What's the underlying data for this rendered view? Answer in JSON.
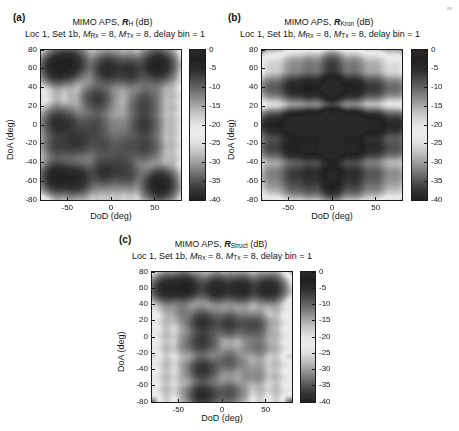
{
  "figure": {
    "background": "#ffffff",
    "panel_count": 3
  },
  "panels": [
    {
      "key": "a",
      "label": "(a)",
      "title_prefix": "MIMO APS, ",
      "title_symbol": "R",
      "title_subscript": "H",
      "title_suffix": " (dB)",
      "subtitle_parts": {
        "loc": "Loc 1, Set 1b, ",
        "m_rx_var": "M",
        "m_rx_sub": "Rx",
        "m_rx_val": " = 8, ",
        "m_tx_var": "M",
        "m_tx_sub": "Tx",
        "m_tx_val": " = 8, delay bin = 1"
      },
      "subtitle_plain": "Loc 1, Set 1b, M_Rx = 8, M_Tx = 8, delay bin = 1",
      "xlabel": "DoD (deg)",
      "ylabel": "DoA (deg)",
      "xticks": [
        -50,
        0,
        50
      ],
      "yticks": [
        80,
        60,
        40,
        20,
        0,
        -20,
        -40,
        -60,
        -80
      ],
      "xlim": [
        -80,
        80
      ],
      "ylim": [
        -80,
        80
      ],
      "colorbar": {
        "ticks": [
          0,
          -5,
          -10,
          -15,
          -20,
          -25,
          -30,
          -35,
          -40
        ],
        "tick_labels": [
          "0",
          "-5",
          "-10",
          "-15",
          "-20",
          "-25",
          "-30",
          "-35",
          "-40"
        ],
        "range": [
          -40,
          0
        ],
        "unit": "dB"
      }
    },
    {
      "key": "b",
      "label": "(b)",
      "title_prefix": "MIMO APS, ",
      "title_symbol": "R",
      "title_subscript": "Kron",
      "title_suffix": " (dB)",
      "subtitle_parts": {
        "loc": "Loc 1, Set 1b, ",
        "m_rx_var": "M",
        "m_rx_sub": "Rx",
        "m_rx_val": " = 8, ",
        "m_tx_var": "M",
        "m_tx_sub": "Tx",
        "m_tx_val": " = 8, delay bin = 1"
      },
      "subtitle_plain": "Loc 1, Set 1b, M_Rx = 8, M_Tx = 8, delay bin = 1",
      "xlabel": "DoD (deg)",
      "ylabel": "DoA (deg)",
      "xticks": [
        -50,
        0,
        50
      ],
      "yticks": [
        80,
        60,
        40,
        20,
        0,
        -20,
        -40,
        -60,
        -80
      ],
      "xlim": [
        -80,
        80
      ],
      "ylim": [
        -80,
        80
      ],
      "colorbar": {
        "ticks": [
          0,
          -5,
          -10,
          -15,
          -20,
          -25,
          -30,
          -35,
          -40
        ],
        "tick_labels": [
          "0",
          "-5",
          "-10",
          "-15",
          "-20",
          "-25",
          "-30",
          "-35",
          "-40"
        ],
        "range": [
          -40,
          0
        ],
        "unit": "dB"
      }
    },
    {
      "key": "c",
      "label": "(c)",
      "title_prefix": "MIMO APS, ",
      "title_symbol": "R",
      "title_subscript": "Struct",
      "title_suffix": " (dB)",
      "subtitle_parts": {
        "loc": "Loc 1, Set 1b, ",
        "m_rx_var": "M",
        "m_rx_sub": "Rx",
        "m_rx_val": " = 8, ",
        "m_tx_var": "M",
        "m_tx_sub": "Tx",
        "m_tx_val": " = 8, delay bin = 1"
      },
      "subtitle_plain": "Loc 1, Set 1b, M_Rx = 8, M_Tx = 8, delay bin = 1",
      "xlabel": "DoD (deg)",
      "ylabel": "DoA (deg)",
      "xticks": [
        -50,
        0,
        50
      ],
      "yticks": [
        80,
        60,
        40,
        20,
        0,
        -20,
        -40,
        -60,
        -80
      ],
      "xlim": [
        -80,
        80
      ],
      "ylim": [
        -80,
        80
      ],
      "colorbar": {
        "ticks": [
          0,
          -5,
          -10,
          -15,
          -20,
          -25,
          -30,
          -35,
          -40
        ],
        "tick_labels": [
          "0",
          "-5",
          "-10",
          "-15",
          "-20",
          "-25",
          "-30",
          "-35",
          "-40"
        ],
        "range": [
          -40,
          0
        ],
        "unit": "dB"
      }
    }
  ],
  "chart_data": [
    {
      "type": "heatmap",
      "panel": "a",
      "title": "MIMO APS, R_H (dB)",
      "subtitle": "Loc 1, Set 1b, M_Rx = 8, M_Tx = 8, delay bin = 1",
      "xlabel": "DoD (deg)",
      "ylabel": "DoA (deg)",
      "xlim": [
        -80,
        80
      ],
      "ylim": [
        -80,
        80
      ],
      "zlim": [
        -40,
        0
      ],
      "zunit": "dB",
      "grid": false,
      "legend": "colorbar-right",
      "colormap": "gray-scanned-dark-bright-dark",
      "dod_lobes": [
        -62,
        -46,
        -30,
        -16,
        -4,
        8,
        22,
        38,
        54,
        70
      ],
      "doa_lobes": [
        -68,
        -52,
        -36,
        -22,
        -8,
        4,
        18,
        32,
        48,
        64
      ],
      "peaks": [
        {
          "dod": -62,
          "doa": 62,
          "level": -3
        },
        {
          "dod": -46,
          "doa": 66,
          "level": -4
        },
        {
          "dod": -4,
          "doa": 60,
          "level": -5
        },
        {
          "dod": 22,
          "doa": 58,
          "level": -6
        },
        {
          "dod": 54,
          "doa": 64,
          "level": -3
        },
        {
          "dod": -16,
          "doa": 28,
          "level": -7
        },
        {
          "dod": 38,
          "doa": 22,
          "level": -8
        },
        {
          "dod": 46,
          "doa": 40,
          "level": -14
        },
        {
          "dod": -62,
          "doa": 2,
          "level": -6
        },
        {
          "dod": -46,
          "doa": 0,
          "level": -9
        },
        {
          "dod": -18,
          "doa": 0,
          "level": -9
        },
        {
          "dod": 10,
          "doa": -2,
          "level": -16
        },
        {
          "dod": 38,
          "doa": 0,
          "level": -7
        },
        {
          "dod": -28,
          "doa": -12,
          "level": -12
        },
        {
          "dod": -62,
          "doa": -22,
          "level": -8
        },
        {
          "dod": -40,
          "doa": -20,
          "level": -7
        },
        {
          "dod": -10,
          "doa": -22,
          "level": -9
        },
        {
          "dod": 18,
          "doa": -22,
          "level": -10
        },
        {
          "dod": 40,
          "doa": -24,
          "level": -8
        },
        {
          "dod": 10,
          "doa": -38,
          "level": -11
        },
        {
          "dod": -62,
          "doa": -56,
          "level": -3
        },
        {
          "dod": -40,
          "doa": -58,
          "level": -4
        },
        {
          "dod": -8,
          "doa": -50,
          "level": -6
        },
        {
          "dod": 18,
          "doa": -52,
          "level": -8
        },
        {
          "dod": 56,
          "doa": -64,
          "level": -3
        }
      ],
      "structure_note": "non-separable full-correlation APS, vertical ridge structure"
    },
    {
      "type": "heatmap",
      "panel": "b",
      "title": "MIMO APS, R_Kron (dB)",
      "subtitle": "Loc 1, Set 1b, M_Rx = 8, M_Tx = 8, delay bin = 1",
      "xlabel": "DoD (deg)",
      "ylabel": "DoA (deg)",
      "xlim": [
        -80,
        80
      ],
      "ylim": [
        -80,
        80
      ],
      "zlim": [
        -40,
        0
      ],
      "zunit": "dB",
      "grid": false,
      "legend": "colorbar-right",
      "colormap": "gray-scanned-dark-bright-dark",
      "separable": true,
      "dod_marginal": {
        "centers": [
          -70,
          -46,
          -26,
          0,
          26,
          50,
          74
        ],
        "levels": [
          -14,
          -9,
          -7,
          -2,
          -7,
          -11,
          -15
        ]
      },
      "doa_marginal": {
        "centers": [
          -66,
          -52,
          -24,
          0,
          40,
          64
        ],
        "levels": [
          -13,
          -10,
          -5,
          -1,
          -7,
          -16
        ]
      },
      "peaks": [
        {
          "dod": 0,
          "doa": 0,
          "level": -1
        },
        {
          "dod": -26,
          "doa": 0,
          "level": -6
        },
        {
          "dod": 26,
          "doa": 0,
          "level": -7
        },
        {
          "dod": -70,
          "doa": 0,
          "level": -13
        },
        {
          "dod": 52,
          "doa": 0,
          "level": -12
        },
        {
          "dod": 0,
          "doa": -24,
          "level": -6
        },
        {
          "dod": 0,
          "doa": 40,
          "level": -6
        },
        {
          "dod": 0,
          "doa": -52,
          "level": -10
        },
        {
          "dod": -46,
          "doa": -24,
          "level": -11
        },
        {
          "dod": 26,
          "doa": -24,
          "level": -11
        },
        {
          "dod": 26,
          "doa": 40,
          "level": -11
        },
        {
          "dod": -46,
          "doa": 40,
          "level": -12
        }
      ],
      "structure_note": "separable Kronecker APS = outer product of DoD and DoA marginals"
    },
    {
      "type": "heatmap",
      "panel": "c",
      "title": "MIMO APS, R_Struct (dB)",
      "subtitle": "Loc 1, Set 1b, M_Rx = 8, M_Tx = 8, delay bin = 1",
      "xlabel": "DoD (deg)",
      "ylabel": "DoA (deg)",
      "xlim": [
        -80,
        80
      ],
      "ylim": [
        -80,
        80
      ],
      "zlim": [
        -40,
        0
      ],
      "zunit": "dB",
      "grid": false,
      "legend": "colorbar-right",
      "colormap": "gray-scanned-dark-bright-dark",
      "dod_lobes": [
        -64,
        -46,
        -24,
        -6,
        10,
        26,
        44,
        62
      ],
      "doa_lobes": [
        -66,
        -50,
        -34,
        -14,
        2,
        18,
        34,
        56
      ],
      "peaks": [
        {
          "dod": -64,
          "doa": 60,
          "level": -4
        },
        {
          "dod": -42,
          "doa": 62,
          "level": -3
        },
        {
          "dod": -6,
          "doa": 60,
          "level": -4
        },
        {
          "dod": 22,
          "doa": 60,
          "level": -4
        },
        {
          "dod": 54,
          "doa": 60,
          "level": -4
        },
        {
          "dod": -22,
          "doa": 18,
          "level": -6
        },
        {
          "dod": 8,
          "doa": 16,
          "level": -7
        },
        {
          "dod": 36,
          "doa": 14,
          "level": -8
        },
        {
          "dod": -22,
          "doa": -6,
          "level": -7
        },
        {
          "dod": -46,
          "doa": 32,
          "level": -14
        },
        {
          "dod": -36,
          "doa": -10,
          "level": -15
        },
        {
          "dod": -22,
          "doa": -40,
          "level": -6
        },
        {
          "dod": 8,
          "doa": -30,
          "level": -10
        },
        {
          "dod": -22,
          "doa": -72,
          "level": -5
        },
        {
          "dod": 8,
          "doa": -70,
          "level": -9
        },
        {
          "dod": 40,
          "doa": -12,
          "level": -12
        },
        {
          "dod": 36,
          "doa": -46,
          "level": -14
        }
      ],
      "structure_note": "structured estimator APS, strong vertical ridges at DoD ~ -22 and +8"
    }
  ]
}
